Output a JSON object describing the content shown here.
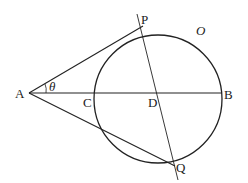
{
  "diagram": {
    "type": "geometry",
    "circle": {
      "name": "O",
      "label": "O"
    },
    "points": {
      "A": "A",
      "P": "P",
      "Q": "Q",
      "B": "B",
      "C": "C",
      "D": "D"
    },
    "angle_label": "θ",
    "segments": [
      "AP",
      "AQ",
      "AB",
      "PQ"
    ],
    "colors": {
      "stroke": "#222222",
      "background": "#ffffff"
    }
  }
}
